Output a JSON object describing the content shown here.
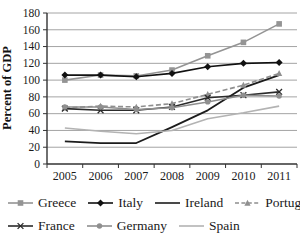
{
  "chart_data": {
    "type": "line",
    "title": "",
    "xlabel": "",
    "ylabel": "Percent of GDP",
    "x": [
      "2005",
      "2006",
      "2007",
      "2008",
      "2009",
      "2010",
      "2011"
    ],
    "ylim": [
      0,
      180
    ],
    "yticks": [
      0,
      20,
      40,
      60,
      80,
      100,
      120,
      140,
      160,
      180
    ],
    "grid": true,
    "legend_position": "bottom",
    "legend_rows": [
      [
        0,
        1,
        2,
        3
      ],
      [
        4,
        5,
        6
      ]
    ],
    "series": [
      {
        "name": "Greece",
        "values": [
          100,
          106,
          105,
          112,
          129,
          145,
          167
        ],
        "color": "#949494",
        "marker": "square",
        "dash": "solid"
      },
      {
        "name": "Italy",
        "values": [
          106,
          106,
          104,
          108,
          116,
          120,
          121
        ],
        "color": "#111111",
        "marker": "diamond",
        "dash": "solid"
      },
      {
        "name": "Ireland",
        "values": [
          27,
          25,
          25,
          44,
          64,
          91,
          106
        ],
        "color": "#1c1c1c",
        "marker": "none",
        "dash": "solid"
      },
      {
        "name": "Portugal",
        "values": [
          67,
          69,
          68,
          72,
          83,
          94,
          108
        ],
        "color": "#8f8f8f",
        "marker": "triangle",
        "dash": "dashed"
      },
      {
        "name": "France",
        "values": [
          66,
          64,
          64,
          68,
          79,
          82,
          86
        ],
        "color": "#2b2b2b",
        "marker": "x",
        "dash": "solid"
      },
      {
        "name": "Germany",
        "values": [
          68,
          68,
          65,
          67,
          74,
          82,
          81
        ],
        "color": "#8f8f8f",
        "marker": "circle",
        "dash": "solid"
      },
      {
        "name": "Spain",
        "values": [
          43,
          39,
          36,
          40,
          54,
          61,
          69
        ],
        "color": "#b3b3b3",
        "marker": "none",
        "dash": "solid"
      }
    ],
    "axis_color": "#333333",
    "grid_color": "#9a9a9a",
    "tick_label_color": "#1a1a1a"
  }
}
